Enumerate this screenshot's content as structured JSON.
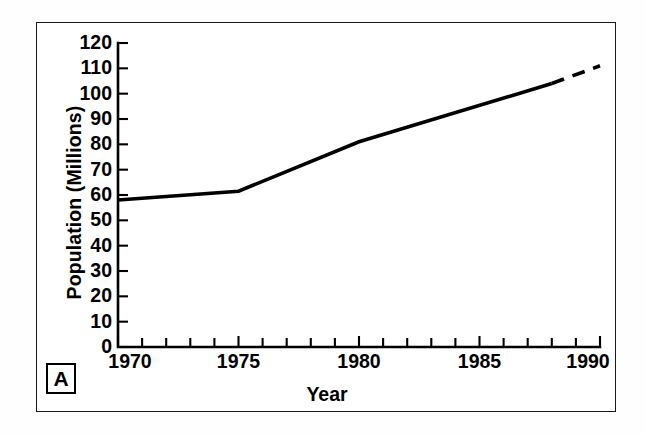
{
  "figure": {
    "panel_label": "A",
    "background_color": "#ffffff",
    "line_color": "#000000",
    "frame_color": "#1a1a1a"
  },
  "chart_data": {
    "type": "line",
    "title": "",
    "subtitle": "",
    "xlabel": "Year",
    "ylabel": "Population (Millions)",
    "xlim": [
      1970,
      1990
    ],
    "ylim": [
      0,
      120
    ],
    "grid": false,
    "legend_position": "none",
    "x_tick_labels": [
      "1970",
      "1975",
      "1980",
      "1985",
      "1990"
    ],
    "x_major_ticks": [
      1970,
      1975,
      1980,
      1985,
      1990
    ],
    "x_minor_tick_interval": 1,
    "y_tick_labels": [
      "0",
      "10",
      "20",
      "30",
      "40",
      "50",
      "60",
      "70",
      "80",
      "90",
      "100",
      "110",
      "120"
    ],
    "y_ticks": [
      0,
      10,
      20,
      30,
      40,
      50,
      60,
      70,
      80,
      90,
      100,
      110,
      120
    ],
    "series": [
      {
        "name": "Population",
        "style": "solid",
        "annotation": "observed",
        "x": [
          1970,
          1975,
          1980,
          1988
        ],
        "values": [
          58,
          61.5,
          81,
          104
        ]
      },
      {
        "name": "Population (projected)",
        "style": "dashed",
        "annotation": "projected",
        "x": [
          1988,
          1990
        ],
        "values": [
          104,
          111
        ]
      }
    ]
  }
}
